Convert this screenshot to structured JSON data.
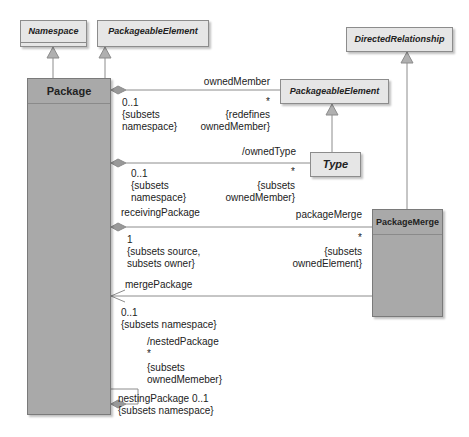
{
  "diagram": {
    "classes": {
      "namespace": {
        "name": "Namespace",
        "abstract": true
      },
      "packageable_element_top": {
        "name": "PackageableElement",
        "abstract": true
      },
      "package": {
        "name": "Package",
        "abstract": false
      },
      "packageable_element_right": {
        "name": "PackageableElement",
        "abstract": true
      },
      "type": {
        "name": "Type",
        "abstract": true
      },
      "directed_relationship": {
        "name": "DirectedRelationship",
        "abstract": true
      },
      "package_merge": {
        "name": "PackageMerge",
        "abstract": false
      }
    },
    "associations": {
      "owned_member": {
        "role": "ownedMember",
        "source_mult": "0..1",
        "source_constraint": "{subsets\nnamespace}",
        "target_mult": "*",
        "target_constraint": "{redefines\nownedMember}"
      },
      "owned_type": {
        "role": "/ownedType",
        "source_mult": "0..1",
        "source_constraint": "{subsets\nnamespace}",
        "target_mult": "*",
        "target_constraint": "{subsets\nownedMember}"
      },
      "package_merge": {
        "source_role": "receivingPackage",
        "role": "packageMerge",
        "source_mult": "1",
        "source_constraint": "{subsets source,\nsubsets owner}",
        "target_mult": "*",
        "target_constraint": "{subsets\nownedElement}"
      },
      "merge_package": {
        "role": "mergePackage",
        "mult": "0..1",
        "constraint": "{subsets namespace}"
      },
      "nested_package": {
        "role": "/nestedPackage",
        "mult": "*",
        "constraint": "{subsets\nownedMemeber}",
        "opposite": "nestingPackage 0..1",
        "opposite_constraint": "{subsets namespace}"
      }
    },
    "colors": {
      "abstract_fill": "#e6e6e6",
      "concrete_fill": "#a9a9a9",
      "line": "#8c8c8c",
      "diamond": "#999999",
      "arrowhead": "#b0b0b0"
    }
  }
}
